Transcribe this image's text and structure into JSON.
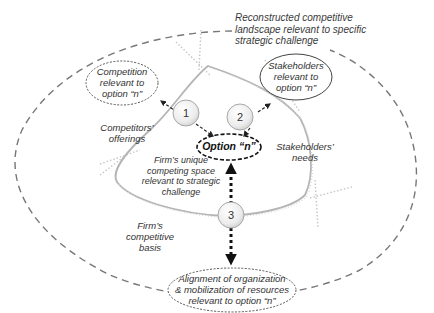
{
  "diagram": {
    "outer_landscape_label": "Reconstructed competitive\nlandscape relevant to specific\nstrategic challenge",
    "center_option": "Option “n”",
    "inner_space_label": "Firm’s unique\ncompeting space\nrelevant to strategic\nchallenge",
    "nodes": [
      {
        "number": "1",
        "target": "Competition\nrelevant to\noption “n”",
        "region": "Competitors’\nofferings"
      },
      {
        "number": "2",
        "target": "Stakeholders\nrelevant to\noption “n”",
        "region": "Stakeholders’\nneeds"
      },
      {
        "number": "3",
        "target": "Alignment of organization\n& mobilization of resources\nrelevant to option “n”",
        "region": "Firm’s\ncompetitive\nbasis"
      }
    ],
    "colors": {
      "outer_dash": "#777777",
      "triangle": "#b8b8b8",
      "dotted_guides": "#c8c8c8",
      "arrows": "#222222",
      "text": "#333333"
    }
  }
}
